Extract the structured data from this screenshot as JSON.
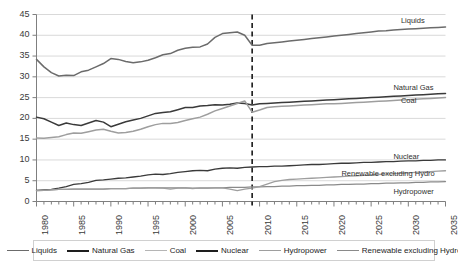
{
  "chart_data": {
    "type": "line",
    "title": "",
    "subtitle": "",
    "xlabel": "",
    "ylabel": "",
    "xlim": [
      1980,
      2035
    ],
    "ylim": [
      0,
      45
    ],
    "ytick_step": 5,
    "xtick_step": 5,
    "grid": true,
    "legend_position": "bottom",
    "yticks": [
      "0",
      "5",
      "10",
      "15",
      "20",
      "25",
      "30",
      "35",
      "40",
      "45"
    ],
    "xticks": [
      "1980",
      "1985",
      "1990",
      "1995",
      "2000",
      "2005",
      "2010",
      "2015",
      "2020",
      "2025",
      "2030",
      "2035"
    ],
    "minor_xtick_interval": 1,
    "annotations": [
      {
        "name": "history-projection-divider",
        "type": "vertical-dashed-line",
        "x": 2009,
        "style": "dashed",
        "color": "#1a1a1a"
      }
    ],
    "x": [
      1980,
      1981,
      1982,
      1983,
      1984,
      1985,
      1986,
      1987,
      1988,
      1989,
      1990,
      1991,
      1992,
      1993,
      1994,
      1995,
      1996,
      1997,
      1998,
      1999,
      2000,
      2001,
      2002,
      2003,
      2004,
      2005,
      2006,
      2007,
      2008,
      2009,
      2010,
      2011,
      2012,
      2013,
      2014,
      2015,
      2016,
      2017,
      2018,
      2019,
      2020,
      2021,
      2022,
      2023,
      2024,
      2025,
      2026,
      2027,
      2028,
      2029,
      2030,
      2031,
      2032,
      2033,
      2034,
      2035
    ],
    "series": [
      {
        "name": "Liquids",
        "color": "#6b6b6b",
        "width": 1.5,
        "label_x": 2029,
        "label_y": 43.5,
        "values": [
          34.2,
          32.4,
          31.0,
          30.2,
          30.4,
          30.3,
          31.2,
          31.6,
          32.4,
          33.2,
          34.4,
          34.2,
          33.7,
          33.4,
          33.6,
          34.0,
          34.6,
          35.3,
          35.6,
          36.4,
          36.9,
          37.1,
          37.2,
          37.9,
          39.5,
          40.4,
          40.6,
          40.8,
          40.0,
          37.6,
          37.6,
          38.0,
          38.2,
          38.4,
          38.6,
          38.8,
          39.0,
          39.2,
          39.4,
          39.6,
          39.8,
          40.0,
          40.2,
          40.4,
          40.6,
          40.8,
          41.0,
          41.1,
          41.3,
          41.4,
          41.5,
          41.6,
          41.7,
          41.8,
          41.9,
          42.0
        ]
      },
      {
        "name": "Natural Gas",
        "color": "#3a3a3a",
        "width": 1.5,
        "label_x": 2028,
        "label_y": 27.2,
        "values": [
          20.3,
          19.9,
          19.1,
          18.3,
          18.9,
          18.5,
          18.3,
          18.9,
          19.5,
          19.1,
          18.0,
          18.6,
          19.2,
          19.6,
          20.0,
          20.6,
          21.2,
          21.4,
          21.6,
          22.1,
          22.6,
          22.6,
          23.0,
          23.1,
          23.3,
          23.2,
          23.4,
          23.7,
          23.6,
          23.2,
          23.5,
          23.6,
          23.7,
          23.8,
          23.9,
          24.0,
          24.1,
          24.2,
          24.3,
          24.4,
          24.5,
          24.6,
          24.7,
          24.8,
          24.9,
          25.0,
          25.1,
          25.2,
          25.3,
          25.4,
          25.5,
          25.6,
          25.7,
          25.8,
          25.9,
          26.0
        ]
      },
      {
        "name": "Coal",
        "color": "#9e9e9e",
        "width": 1.5,
        "label_x": 2029,
        "label_y": 24.2,
        "values": [
          15.3,
          15.2,
          15.4,
          15.6,
          16.1,
          16.5,
          16.4,
          16.8,
          17.2,
          17.4,
          16.9,
          16.5,
          16.6,
          16.9,
          17.4,
          18.0,
          18.5,
          18.8,
          18.8,
          19.0,
          19.5,
          19.9,
          20.3,
          21.0,
          21.8,
          22.4,
          23.0,
          23.6,
          24.2,
          21.5,
          22.0,
          22.6,
          22.8,
          22.9,
          23.0,
          23.1,
          23.2,
          23.3,
          23.4,
          23.5,
          23.5,
          23.6,
          23.7,
          23.8,
          23.9,
          24.0,
          24.1,
          24.2,
          24.3,
          24.4,
          24.5,
          24.6,
          24.7,
          24.8,
          24.9,
          25.0
        ]
      },
      {
        "name": "Nuclear",
        "color": "#3a3a3a",
        "width": 1.3,
        "label_x": 2028,
        "label_y": 10.8,
        "values": [
          2.7,
          2.8,
          2.9,
          3.2,
          3.6,
          4.1,
          4.3,
          4.6,
          5.1,
          5.2,
          5.4,
          5.6,
          5.7,
          5.9,
          6.1,
          6.4,
          6.6,
          6.5,
          6.7,
          7.0,
          7.2,
          7.4,
          7.5,
          7.4,
          7.8,
          8.0,
          8.1,
          8.0,
          8.2,
          8.3,
          8.4,
          8.4,
          8.5,
          8.5,
          8.6,
          8.7,
          8.8,
          8.9,
          8.9,
          9.0,
          9.1,
          9.2,
          9.2,
          9.3,
          9.4,
          9.4,
          9.5,
          9.6,
          9.6,
          9.7,
          9.8,
          9.8,
          9.9,
          9.9,
          10.0,
          10.0
        ]
      },
      {
        "name": "Hydropower",
        "color": "#8a8a8a",
        "width": 1.3,
        "label_x": 2028,
        "label_y": 2.3,
        "values": [
          2.6,
          2.7,
          2.8,
          2.9,
          2.9,
          3.0,
          3.0,
          3.0,
          3.0,
          3.0,
          3.1,
          3.1,
          3.1,
          3.2,
          3.2,
          3.3,
          3.3,
          3.3,
          3.3,
          3.3,
          3.3,
          3.2,
          3.2,
          3.2,
          3.3,
          3.3,
          3.4,
          3.4,
          3.4,
          3.5,
          3.5,
          3.6,
          3.6,
          3.7,
          3.7,
          3.8,
          3.8,
          3.9,
          3.9,
          4.0,
          4.0,
          4.1,
          4.1,
          4.2,
          4.2,
          4.3,
          4.3,
          4.4,
          4.4,
          4.5,
          4.5,
          4.6,
          4.6,
          4.7,
          4.7,
          4.8
        ]
      },
      {
        "name": "Renewable excluding Hydro",
        "color": "#9e9e9e",
        "width": 1.3,
        "label_x": 2021,
        "label_y": 6.6,
        "values": [
          2.6,
          2.7,
          2.8,
          2.9,
          2.9,
          3.0,
          3.0,
          3.0,
          3.0,
          3.0,
          3.1,
          3.1,
          3.1,
          3.2,
          3.2,
          3.3,
          3.3,
          3.2,
          3.0,
          3.2,
          3.3,
          3.1,
          3.3,
          3.3,
          3.3,
          3.3,
          3.0,
          2.6,
          3.0,
          3.2,
          3.6,
          4.2,
          4.8,
          5.1,
          5.3,
          5.4,
          5.5,
          5.6,
          5.7,
          5.8,
          5.9,
          6.0,
          6.1,
          6.2,
          6.3,
          6.4,
          6.5,
          6.6,
          6.7,
          6.8,
          6.9,
          7.0,
          7.1,
          7.2,
          7.3,
          7.4
        ]
      }
    ]
  },
  "legend": {
    "items": [
      {
        "label": "Liquids",
        "color": "#6b6b6b",
        "width": 1.5
      },
      {
        "label": "Natural Gas",
        "color": "#1e1e1e",
        "width": 2
      },
      {
        "label": "Coal",
        "color": "#b5b5b5",
        "width": 1.5
      },
      {
        "label": "Nuclear",
        "color": "#1e1e1e",
        "width": 2
      },
      {
        "label": "Hydropower",
        "color": "#9e9e9e",
        "width": 1.5
      },
      {
        "label": "Renewable excluding Hydro",
        "color": "#8a8a8a",
        "width": 1.5
      }
    ]
  },
  "colors": {
    "axis": "#7f7f7f",
    "gridline": "#d9d9d9",
    "text": "#3a3a3a",
    "background": "#ffffff",
    "divider": "#1a1a1a"
  }
}
